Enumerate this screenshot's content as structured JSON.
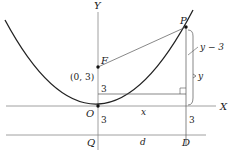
{
  "diagram": {
    "axes": {
      "y_label": "Y",
      "x_label": "X"
    },
    "points": {
      "origin": "O",
      "focus": "F",
      "focus_coords": "(0, 3)",
      "point_on_curve": "P",
      "directrix_foot": "D",
      "directrix_on_axis": "Q"
    },
    "distances": {
      "f_to_o": "3",
      "o_to_q": "3",
      "x_axis_to_directrix": "3",
      "horizontal": "x",
      "directrix_segment": "d",
      "upper_brace": "y − 3",
      "lower_brace": "y"
    },
    "colors": {
      "line": "#333333",
      "curve": "#222222",
      "axis": "#888888"
    }
  }
}
